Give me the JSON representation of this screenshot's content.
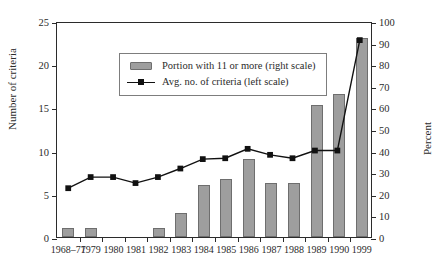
{
  "chart_data": {
    "type": "bar",
    "title": "",
    "subtitle": "",
    "xlabel": "",
    "ylabel": "Number of criteria",
    "y2label": "Percent",
    "grid": false,
    "legend_position": "upper-left-inside",
    "categories": [
      "1968–77",
      "1979",
      "1980",
      "1981",
      "1982",
      "1983",
      "1984",
      "1985",
      "1986",
      "1987",
      "1988",
      "1989",
      "1990",
      "1999"
    ],
    "ylim": [
      0,
      25
    ],
    "y2lim": [
      0,
      100
    ],
    "yticks": [
      0,
      5,
      10,
      15,
      20,
      25
    ],
    "y2ticks": [
      0,
      10,
      20,
      30,
      40,
      50,
      60,
      70,
      80,
      90,
      100
    ],
    "series": [
      {
        "name": "Portion with 11 or more (right scale)",
        "type": "bar",
        "axis": "right",
        "unit": "percent",
        "color": "#9e9e9e",
        "edge_color": "#6e6e6e",
        "values": [
          4,
          4,
          0,
          0,
          4,
          11,
          24,
          27,
          36,
          25,
          25,
          61,
          66,
          92
        ]
      },
      {
        "name": "Avg. no. of criteria (left scale)",
        "type": "line",
        "axis": "left",
        "unit": "criteria",
        "color": "#111111",
        "marker": "square",
        "values": [
          5.7,
          7.0,
          7.0,
          6.3,
          7.0,
          8.0,
          9.1,
          9.2,
          10.3,
          9.6,
          9.2,
          10.1,
          10.1,
          23.0
        ]
      }
    ]
  },
  "legend": {
    "entries": [
      {
        "label": "Portion with 11 or more (right scale)",
        "key": "bar-swatch"
      },
      {
        "label": "Avg. no. of criteria (left scale)",
        "key": "line-swatch"
      }
    ]
  },
  "axes": {
    "left": {
      "title": "Number of criteria",
      "ticks": [
        "0",
        "5",
        "10",
        "15",
        "20",
        "25"
      ]
    },
    "right": {
      "title": "Percent",
      "ticks": [
        "0",
        "10",
        "20",
        "30",
        "40",
        "50",
        "60",
        "70",
        "80",
        "90",
        "100"
      ]
    },
    "bottom": {
      "ticks": [
        "1968–77",
        "1979",
        "1980",
        "1981",
        "1982",
        "1983",
        "1984",
        "1985",
        "1986",
        "1987",
        "1988",
        "1989",
        "1990",
        "1999"
      ]
    }
  }
}
